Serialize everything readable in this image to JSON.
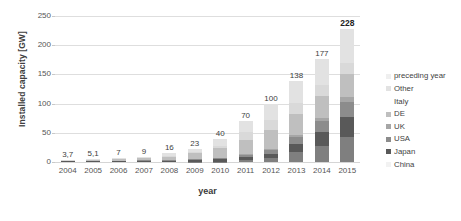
{
  "chart_data": {
    "type": "bar",
    "subtype": "stacked-bar",
    "title": "",
    "xlabel": "year",
    "ylabel": "Installed capacity [GW]",
    "categories": [
      "2004",
      "2005",
      "2006",
      "2007",
      "2008",
      "2009",
      "2010",
      "2011",
      "2012",
      "2013",
      "2014",
      "2015"
    ],
    "ylim": [
      0,
      250
    ],
    "yticks": [
      0,
      50,
      100,
      150,
      200,
      250
    ],
    "grid": true,
    "legend_position": "right",
    "totals": [
      "3,7",
      "5,1",
      "7",
      "9",
      "16",
      "23",
      "40",
      "70",
      "100",
      "138",
      "177",
      "228"
    ],
    "total_values": [
      3.7,
      5.1,
      7,
      9,
      16,
      23,
      40,
      70,
      100,
      138,
      177,
      228
    ],
    "series": [
      {
        "name": "China",
        "color": "#7f7f7f",
        "values": [
          0,
          0,
          0,
          0,
          0.1,
          0.3,
          0.8,
          3,
          7,
          18,
          28,
          43
        ]
      },
      {
        "name": "Japan",
        "color": "#595959",
        "values": [
          1.1,
          1.4,
          1.7,
          1.9,
          2.1,
          2.6,
          3.6,
          4.9,
          6.6,
          13.6,
          23.3,
          34.4
        ]
      },
      {
        "name": "USA",
        "color": "#8c8c8c",
        "values": [
          0.4,
          0.5,
          0.6,
          0.8,
          1.2,
          1.6,
          2.5,
          4,
          7.3,
          12,
          18.3,
          25.6
        ]
      },
      {
        "name": "UK",
        "color": "#a6a6a6",
        "values": [
          0,
          0,
          0,
          0,
          0,
          0.1,
          0.1,
          1,
          1.8,
          2.9,
          5.2,
          8.8
        ]
      },
      {
        "name": "DE",
        "color": "#bfbfbf",
        "values": [
          1.1,
          2,
          2.9,
          4.2,
          6.1,
          10.6,
          17.6,
          25.4,
          32.6,
          36.3,
          38.2,
          39.7
        ]
      },
      {
        "name": "Italy",
        "color": "#d9d9d9",
        "values": [
          0.03,
          0.05,
          0.05,
          0.1,
          0.5,
          1.2,
          3.5,
          12.8,
          16.4,
          18.1,
          18.6,
          18.9
        ]
      },
      {
        "name": "Other",
        "color": "#e2e2e2",
        "values": [
          1.07,
          1.15,
          1.75,
          2,
          6,
          6.6,
          11.9,
          18.9,
          28.3,
          37.1,
          45.4,
          57.6
        ]
      },
      {
        "name": "preceding year",
        "color": "#efefef",
        "values": [
          0,
          0,
          0,
          0,
          0,
          0,
          0,
          0,
          0,
          0,
          0,
          0
        ]
      }
    ],
    "legend_entries": [
      {
        "label": "preceding year",
        "color": "#efefef"
      },
      {
        "label": "Other",
        "color": "#e2e2e2"
      },
      {
        "label": "Italy",
        "color": "#ffffff"
      },
      {
        "label": "DE",
        "color": "#bfbfbf"
      },
      {
        "label": "UK",
        "color": "#a6a6a6"
      },
      {
        "label": "USA",
        "color": "#8c8c8c"
      },
      {
        "label": "Japan",
        "color": "#595959"
      },
      {
        "label": "China",
        "color": "#f2f2f2"
      }
    ]
  }
}
